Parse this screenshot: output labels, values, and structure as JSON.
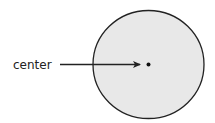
{
  "diagram": {
    "title": "",
    "shape": "circle",
    "fill_color": "#e8e8e8",
    "stroke_color": "#222222",
    "point_color": "#111111",
    "annotations": [
      {
        "text": "center",
        "target": "center-point",
        "arrow": true
      }
    ]
  }
}
